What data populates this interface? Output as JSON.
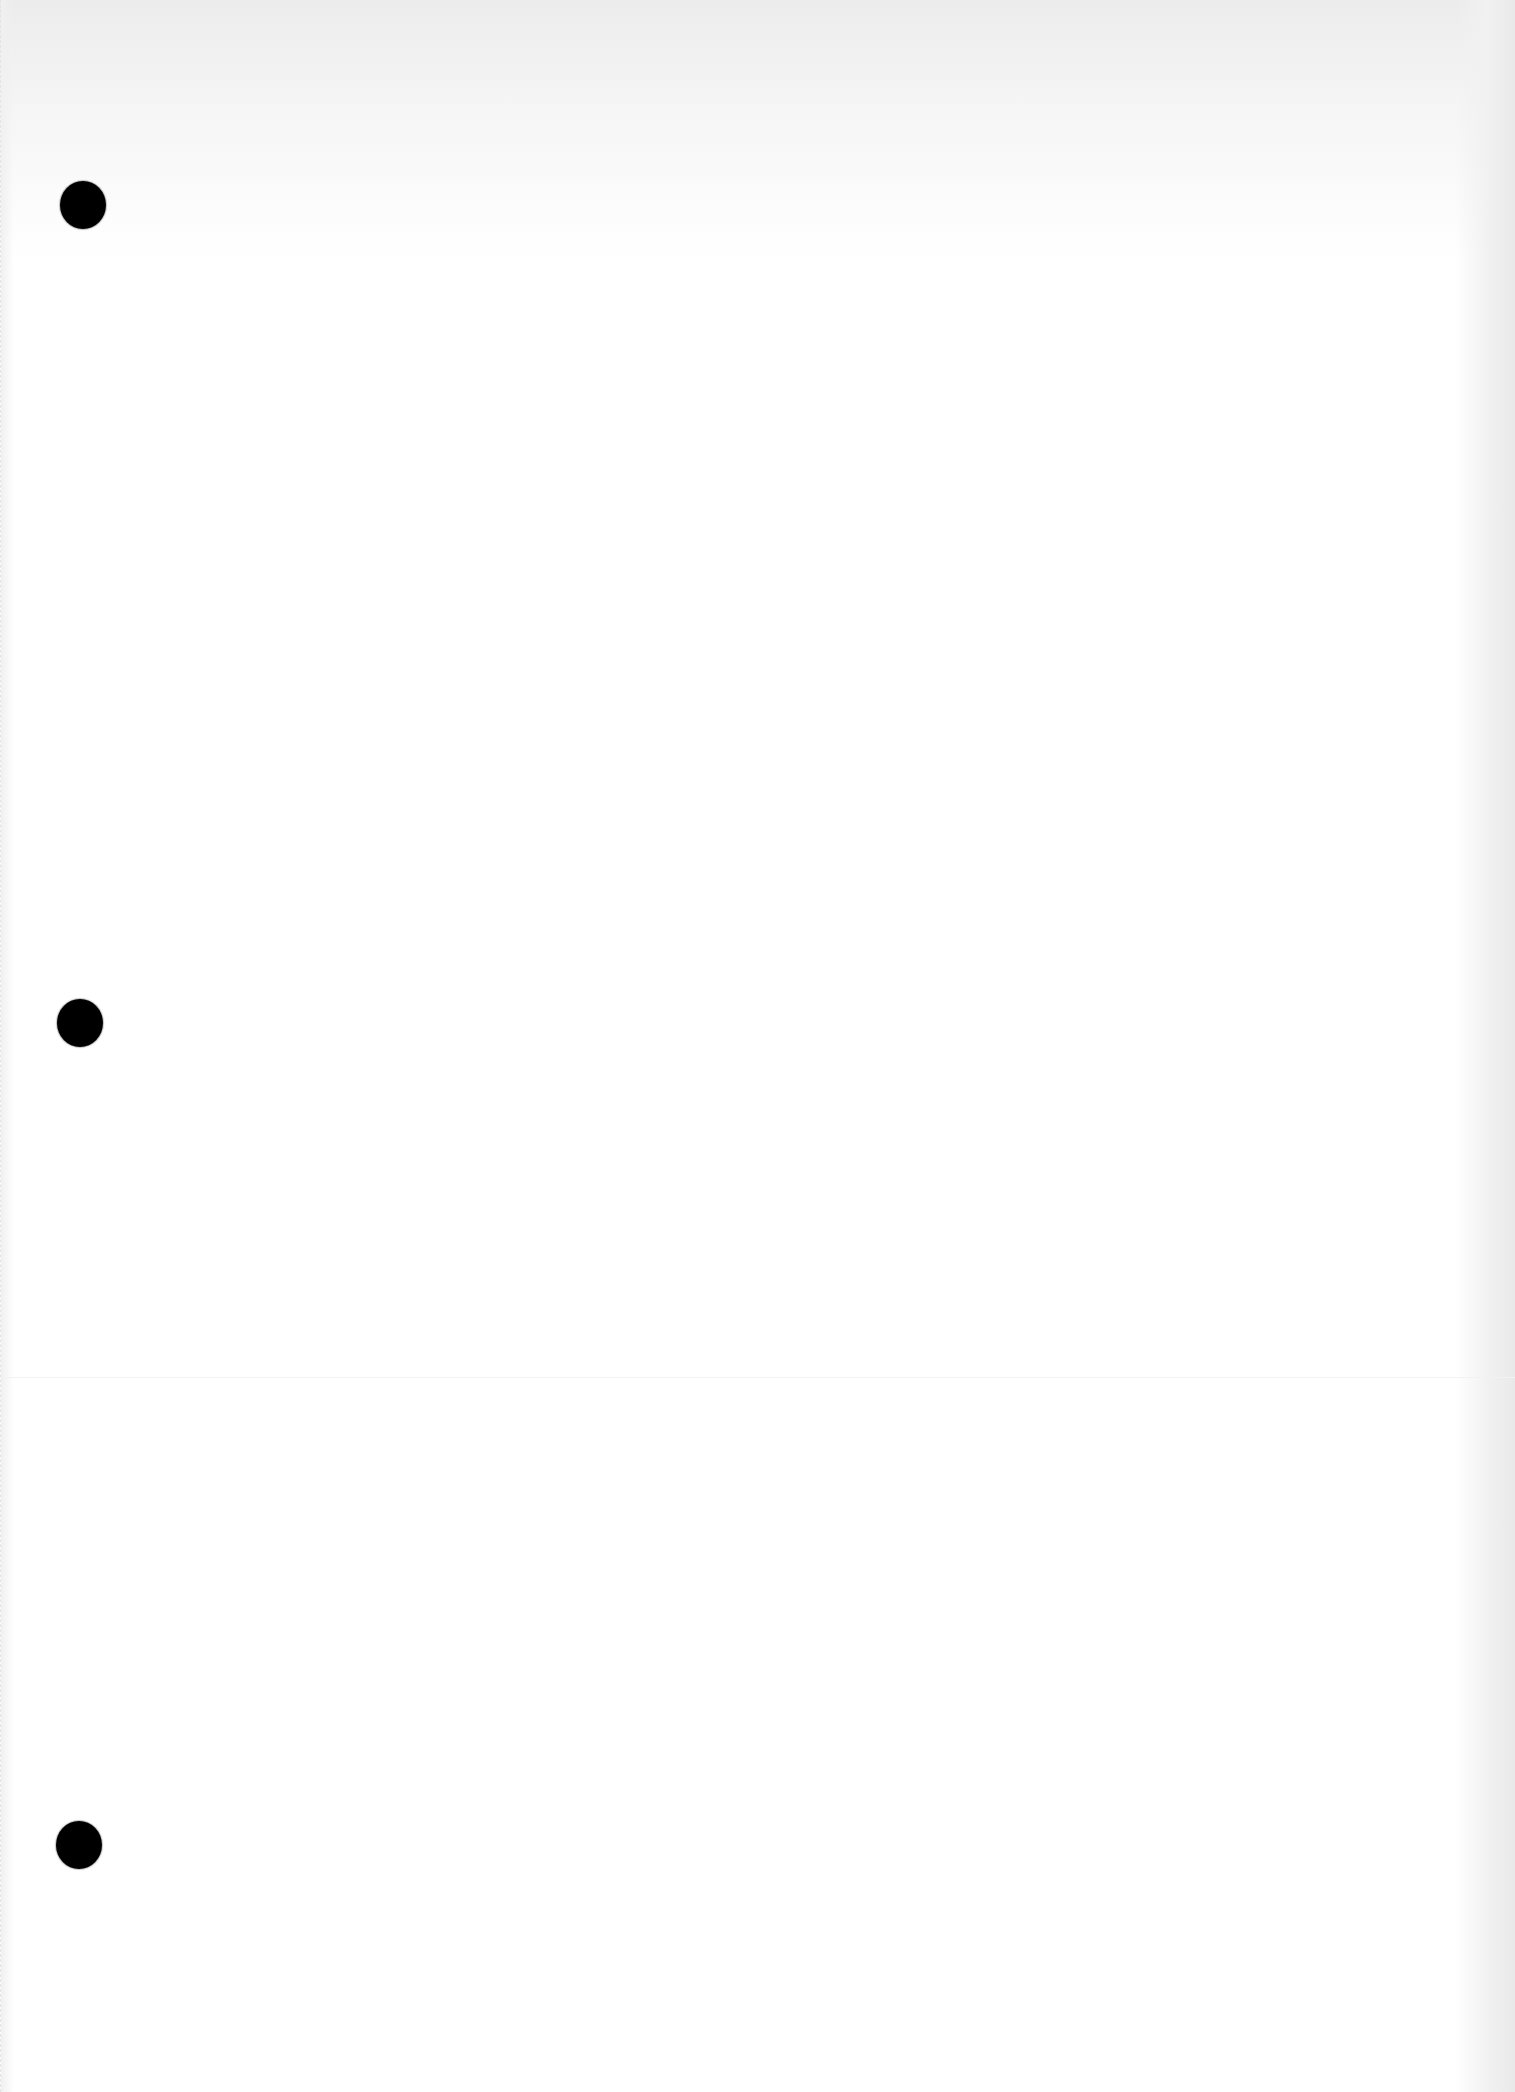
{
  "page": {
    "background": "#ffffff",
    "shade_color": "#e9e9e9",
    "text_content": []
  },
  "punch_holes": [
    {
      "cx": 83,
      "cy": 205,
      "w": 46,
      "h": 48,
      "color": "#000000"
    },
    {
      "cx": 80,
      "cy": 1023,
      "w": 46,
      "h": 48,
      "color": "#000000"
    },
    {
      "cx": 79,
      "cy": 1845,
      "w": 46,
      "h": 48,
      "color": "#000000"
    }
  ],
  "fold_line_y": 1377
}
